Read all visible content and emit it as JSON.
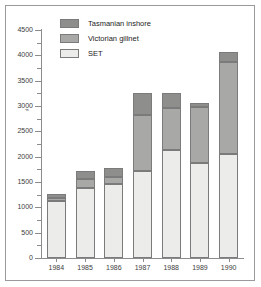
{
  "chart_data": {
    "type": "bar",
    "subtype": "stacked",
    "title": "",
    "xlabel": "",
    "ylabel": "",
    "categories": [
      "1984",
      "1985",
      "1986",
      "1987",
      "1988",
      "1989",
      "1990"
    ],
    "series": [
      {
        "name": "SET",
        "color": "#ececeb",
        "values": [
          1130,
          1390,
          1470,
          1710,
          2130,
          1880,
          2050
        ]
      },
      {
        "name": "Victorian gillnet",
        "color": "#a8a8a6",
        "values": [
          60,
          160,
          130,
          1110,
          840,
          1110,
          1820
        ]
      },
      {
        "name": "Tasmanian inshore",
        "color": "#8e8e8c",
        "values": [
          70,
          170,
          180,
          430,
          290,
          70,
          190
        ]
      }
    ],
    "totals": [
      1260,
      1720,
      1780,
      3250,
      3260,
      3060,
      4060
    ],
    "ylim": [
      0,
      4500
    ],
    "ytick_labels": [
      "0",
      "500",
      "1000",
      "1500",
      "2000",
      "2500",
      "3000",
      "3500",
      "4000",
      "4500"
    ],
    "ytick_values": [
      0,
      500,
      1000,
      1500,
      2000,
      2500,
      3000,
      3500,
      4000,
      4500
    ],
    "ytick_minor_values": [
      250,
      750,
      1250,
      1750,
      2250,
      2750,
      3250,
      3750,
      4250
    ],
    "grid": false,
    "legend_position": "top-left",
    "legend": [
      {
        "label": "Tasmanian inshore",
        "color": "#8e8e8c"
      },
      {
        "label": "Victorian gillnet",
        "color": "#a8a8a6"
      },
      {
        "label": "SET",
        "color": "#ececeb"
      }
    ]
  },
  "figure": {
    "background": "#ffffff",
    "frame_color": "#9a9a9a",
    "axis_color": "#8c8c8c",
    "bar_edge_color": "#7b7b7b",
    "text_color": "#3d3d3d",
    "artifact_mark": "⌁"
  }
}
